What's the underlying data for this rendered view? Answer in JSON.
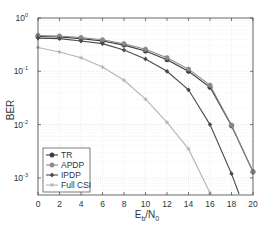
{
  "chart_data": {
    "type": "line",
    "title": "",
    "xlabel": "E_b/N_0",
    "xlabel_main": "E",
    "xlabel_sub1": "b",
    "xlabel_mid": "/N",
    "xlabel_sub2": "0",
    "ylabel": "BER",
    "x_scale": "linear",
    "y_scale": "log",
    "xlim": [
      0,
      20
    ],
    "ylim": [
      0.0005,
      1
    ],
    "x_ticks": [
      0,
      2,
      4,
      6,
      8,
      10,
      12,
      14,
      16,
      18,
      20
    ],
    "y_ticks": [
      {
        "base": "10",
        "exp": "0",
        "value": 1
      },
      {
        "base": "10",
        "exp": "-1",
        "value": 0.1
      },
      {
        "base": "10",
        "exp": "-2",
        "value": 0.01
      },
      {
        "base": "10",
        "exp": "-3",
        "value": 0.001
      }
    ],
    "grid": true,
    "legend_position": "lower left",
    "x": [
      0,
      2,
      4,
      6,
      8,
      10,
      12,
      14,
      16,
      18,
      20
    ],
    "series": [
      {
        "name": "TR",
        "color": "#3a3a3a",
        "marker": "circle",
        "values": [
          0.45,
          0.44,
          0.41,
          0.37,
          0.31,
          0.24,
          0.165,
          0.1,
          0.05,
          0.0095,
          0.0013
        ]
      },
      {
        "name": "APDP",
        "color": "#8a8a8a",
        "marker": "circle",
        "values": [
          0.47,
          0.46,
          0.43,
          0.39,
          0.33,
          0.26,
          0.18,
          0.11,
          0.055,
          0.0098,
          0.0013
        ]
      },
      {
        "name": "IPDP",
        "color": "#4a4a4a",
        "marker": "diamond",
        "values": [
          0.42,
          0.41,
          0.37,
          0.33,
          0.25,
          0.17,
          0.1,
          0.045,
          0.01,
          0.0012,
          null
        ]
      },
      {
        "name": "Full CSI",
        "color": "#b4b4b4",
        "marker": "star",
        "values": [
          0.28,
          0.23,
          0.18,
          0.12,
          0.068,
          0.03,
          0.011,
          0.0035,
          0.00052,
          null,
          null
        ]
      }
    ],
    "extrapolated_end": {
      "IPDP": [
        18.7,
        0.0005
      ]
    }
  }
}
